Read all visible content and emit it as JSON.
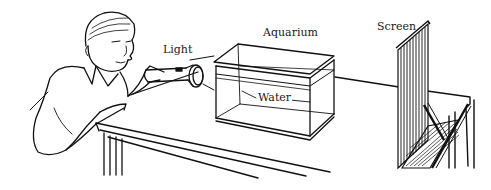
{
  "figure": {
    "labels": {
      "light": "Light",
      "aquarium": "Aquarium",
      "water": "Water",
      "screen": "Screen"
    }
  },
  "colors": {
    "ink": "#111111",
    "background": "#ffffff"
  }
}
